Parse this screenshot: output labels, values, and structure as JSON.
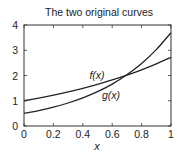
{
  "chart_data": {
    "type": "line",
    "title": "The two original curves",
    "xlabel": "x",
    "ylabel": "",
    "xlim": [
      0,
      1
    ],
    "ylim": [
      0,
      4
    ],
    "xticks": [
      0,
      0.2,
      0.4,
      0.6,
      0.8,
      1
    ],
    "xtick_labels": [
      "0",
      "0.2",
      "0.4",
      "0.6",
      "0.8",
      "1"
    ],
    "yticks": [
      0,
      1,
      2,
      3,
      4
    ],
    "ytick_labels": [
      "0",
      "1",
      "2",
      "3",
      "4"
    ],
    "grid": false,
    "legend": "none (inline curve labels)",
    "series": [
      {
        "name": "f(x)",
        "label": "f(x)",
        "x": [
          0,
          0.1,
          0.2,
          0.3,
          0.4,
          0.5,
          0.6,
          0.7,
          0.8,
          0.9,
          1.0
        ],
        "values": [
          1.0,
          1.105,
          1.221,
          1.35,
          1.492,
          1.649,
          1.822,
          2.014,
          2.226,
          2.46,
          2.718
        ],
        "color": "#222222"
      },
      {
        "name": "g(x)",
        "label": "g(x)",
        "x": [
          0,
          0.1,
          0.2,
          0.3,
          0.4,
          0.5,
          0.6,
          0.7,
          0.8,
          0.9,
          1.0
        ],
        "values": [
          0.5,
          0.611,
          0.746,
          0.911,
          1.113,
          1.359,
          1.66,
          2.028,
          2.477,
          3.025,
          3.695
        ],
        "color": "#222222"
      }
    ],
    "annotations": [
      {
        "text": "f(x)",
        "x": 0.46,
        "y": 2.1
      },
      {
        "text": "g(x)",
        "x": 0.56,
        "y": 1.3
      }
    ]
  }
}
